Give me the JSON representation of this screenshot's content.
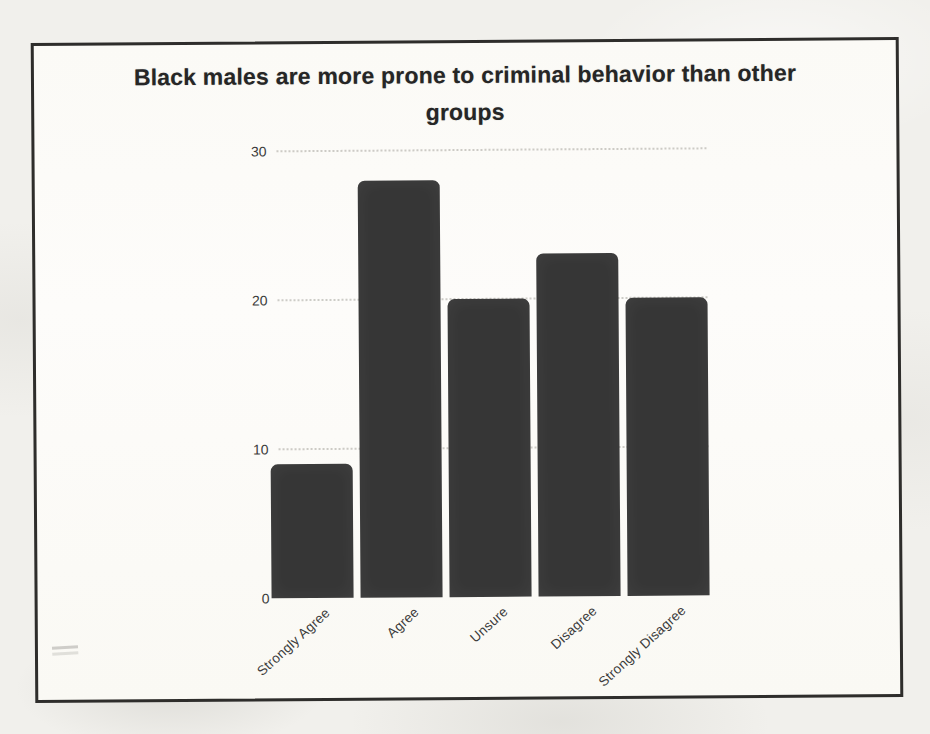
{
  "colors": {
    "bar": "#363636",
    "frame_border": "#2e2d2b",
    "page_background": "#f1f0ec",
    "paper_background": "#fbfaf7",
    "grid_line": "#9e9c94",
    "title_text": "#262626",
    "axis_text": "#3c3c3c"
  },
  "chart_data": {
    "type": "bar",
    "title": "Black males are more prone to criminal behavior than other groups",
    "title_lines": [
      "Black males are more prone to criminal behavior than other",
      "groups"
    ],
    "categories": [
      "Strongly Agree",
      "Agree",
      "Unsure",
      "Disagree",
      "Strongly Disagree"
    ],
    "values": [
      9,
      28,
      20,
      23,
      20
    ],
    "xlabel": "",
    "ylabel": "",
    "ylim": [
      0,
      30
    ],
    "yticks": [
      0,
      10,
      20,
      30
    ],
    "grid": "horizontal-dotted",
    "legend_position": "none",
    "bar_orientation": "vertical"
  }
}
